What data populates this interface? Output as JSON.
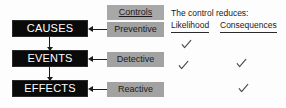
{
  "diagram": {
    "chain": [
      {
        "label": "CAUSES"
      },
      {
        "label": "EVENTS"
      },
      {
        "label": "EFFECTS"
      }
    ],
    "controls_header": "Controls",
    "controls": [
      {
        "label": "Preventive"
      },
      {
        "label": "Detective"
      },
      {
        "label": "Reactive"
      }
    ],
    "matrix": {
      "title": "The control reduces:",
      "columns": [
        "Likelihood",
        "Consequences"
      ],
      "rows": [
        {
          "control": "Preventive",
          "likelihood": true,
          "consequences": false
        },
        {
          "control": "Detective",
          "likelihood": true,
          "consequences": true
        },
        {
          "control": "Reactive",
          "likelihood": false,
          "consequences": true
        }
      ],
      "check_glyph": "check-mark"
    },
    "colors": {
      "chain_box": "#0a0a0a",
      "chain_text": "#ffffff",
      "control_box": "#a2a2a2",
      "control_text": "#1b1b1b",
      "arrow": "#1a1a1a",
      "check": "#4a4a4a",
      "background": "#fdfdfd"
    }
  }
}
